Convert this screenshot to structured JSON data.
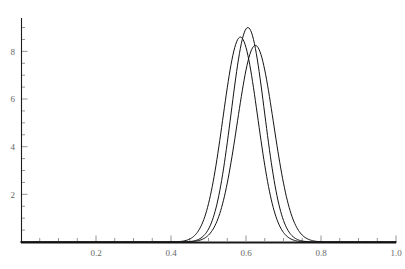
{
  "chart_data": {
    "type": "line",
    "title": "",
    "subtitle": "",
    "xlabel": "",
    "ylabel": "",
    "xlim": [
      0,
      1.0
    ],
    "ylim": [
      0,
      9.4
    ],
    "grid": false,
    "legend": false,
    "legend_position": "none",
    "background_color": "#ffffff",
    "line_color": "#141414",
    "axis_color": "#1a1a1a",
    "tick_label_color": "#666666",
    "x_ticks_major": [
      0.2,
      0.4,
      0.6,
      0.8,
      1.0
    ],
    "x_tick_labels": [
      "0.2",
      "0.4",
      "0.6",
      "0.8",
      "1.0"
    ],
    "x_ticks_minor": [
      0.05,
      0.1,
      0.15,
      0.25,
      0.3,
      0.35,
      0.45,
      0.5,
      0.55,
      0.65,
      0.7,
      0.75,
      0.85,
      0.9,
      0.95
    ],
    "y_ticks_major": [
      2,
      4,
      6,
      8
    ],
    "y_tick_labels": [
      "2",
      "4",
      "6",
      "8"
    ],
    "y_ticks_minor": [
      0.5,
      1,
      1.5,
      2.5,
      3,
      3.5,
      4.5,
      5,
      5.5,
      6.5,
      7,
      7.5,
      8.5,
      9
    ],
    "series": [
      {
        "name": "curve-1",
        "peak_x": 0.585,
        "peak_y": 8.6,
        "sigma": 0.0464,
        "x": [
          0.4,
          0.42,
          0.44,
          0.46,
          0.48,
          0.5,
          0.52,
          0.54,
          0.56,
          0.58,
          0.585,
          0.6,
          0.62,
          0.64,
          0.66,
          0.68,
          0.7,
          0.72,
          0.74,
          0.76,
          0.78,
          0.8
        ],
        "values": [
          0.04,
          0.12,
          0.32,
          0.77,
          1.64,
          3.1,
          5.21,
          7.18,
          8.31,
          8.58,
          8.6,
          8.16,
          6.56,
          4.6,
          2.8,
          1.49,
          0.7,
          0.29,
          0.1,
          0.03,
          0.01,
          0.0
        ]
      },
      {
        "name": "curve-2",
        "peak_x": 0.605,
        "peak_y": 9.0,
        "sigma": 0.0443,
        "x": [
          0.42,
          0.44,
          0.46,
          0.48,
          0.5,
          0.52,
          0.54,
          0.56,
          0.58,
          0.6,
          0.605,
          0.62,
          0.64,
          0.66,
          0.68,
          0.7,
          0.72,
          0.74,
          0.76,
          0.78,
          0.8
        ],
        "values": [
          0.05,
          0.15,
          0.41,
          0.99,
          2.1,
          3.94,
          6.4,
          8.24,
          8.97,
          8.99,
          9.0,
          8.46,
          6.7,
          4.55,
          2.66,
          1.35,
          0.59,
          0.22,
          0.07,
          0.02,
          0.0
        ]
      },
      {
        "name": "curve-3",
        "peak_x": 0.625,
        "peak_y": 8.25,
        "sigma": 0.0483,
        "x": [
          0.42,
          0.44,
          0.46,
          0.48,
          0.5,
          0.52,
          0.54,
          0.56,
          0.58,
          0.6,
          0.62,
          0.625,
          0.64,
          0.66,
          0.68,
          0.7,
          0.72,
          0.74,
          0.76,
          0.78,
          0.8
        ],
        "values": [
          0.02,
          0.06,
          0.17,
          0.43,
          0.98,
          1.99,
          3.6,
          5.73,
          7.5,
          8.17,
          8.24,
          8.25,
          7.91,
          6.4,
          4.41,
          2.59,
          1.29,
          0.55,
          0.2,
          0.06,
          0.02
        ]
      }
    ]
  },
  "plot_geometry": {
    "origin_x_px": 21,
    "origin_y_px": 242,
    "x_axis_end_px": 396,
    "y_axis_top_px": 18,
    "px_per_x_unit": 375,
    "px_per_y_unit": 25.7
  }
}
